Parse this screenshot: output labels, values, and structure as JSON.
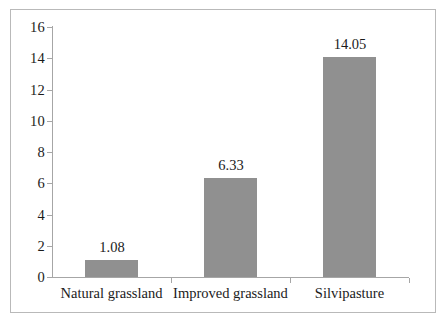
{
  "chart_data": {
    "type": "bar",
    "title": "",
    "subtitle": "",
    "xlabel": "",
    "ylabel": "",
    "categories": [
      "Natural grassland",
      "Improved grassland",
      "Silvipasture"
    ],
    "values": [
      1.08,
      6.33,
      14.05
    ],
    "value_labels": [
      "1.08",
      "6.33",
      "14.05"
    ],
    "ylim": [
      0,
      16
    ],
    "ytick_values": [
      0,
      2,
      4,
      6,
      8,
      10,
      12,
      14,
      16
    ],
    "ytick_labels": [
      "0",
      "2",
      "4",
      "6",
      "8",
      "10",
      "12",
      "14",
      "16"
    ],
    "grid": false,
    "legend": false,
    "legend_position": "none",
    "bar_color": "#909090",
    "axis_color": "#a6a6a6",
    "text_color": "#1b1b1b",
    "frame_color": "#b9b9b9",
    "background": "#ffffff"
  }
}
